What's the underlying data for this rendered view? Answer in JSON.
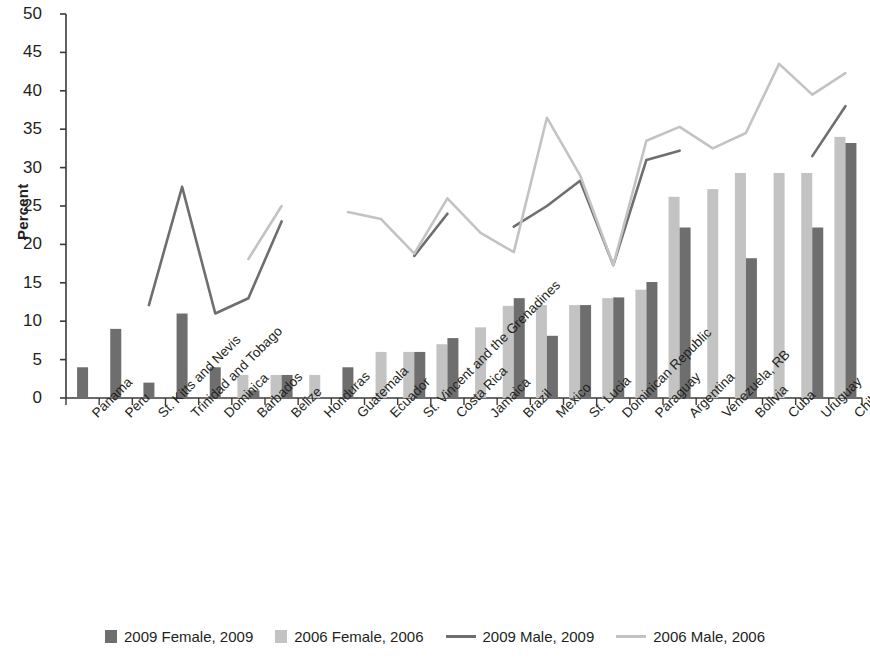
{
  "chart_data": {
    "type": "bar",
    "title": "",
    "xlabel": "",
    "ylabel": "Percent",
    "ylim": [
      0,
      50
    ],
    "ytick_step": 5,
    "yticks": [
      0,
      5,
      10,
      15,
      20,
      25,
      30,
      35,
      40,
      45,
      50
    ],
    "grid": false,
    "legend_position": "bottom",
    "categories": [
      "Panama",
      "Peru",
      "St. Kitts and Nevis",
      "Trinidad and Tobago",
      "Dominica",
      "Barbados",
      "Belize",
      "Honduras",
      "Guatemala",
      "Ecuador",
      "St. Vincent and the Grenadines",
      "Costa Rica",
      "Jamaica",
      "Brazil",
      "Mexico",
      "St. Lucia",
      "Dominican Republic",
      "Paraguay",
      "Argentina",
      "Venezuela, RB",
      "Bolivia",
      "Cuba",
      "Uruguay",
      "Chile"
    ],
    "series": [
      {
        "name": "2006 Female, 2006",
        "kind": "bar",
        "color": "#c3c3c3",
        "values": [
          null,
          null,
          null,
          null,
          null,
          3.0,
          3.0,
          3.0,
          null,
          6.0,
          6.0,
          7.0,
          9.2,
          12.0,
          12.1,
          12.1,
          13.0,
          14.1,
          26.2,
          27.2,
          29.3,
          29.3,
          29.3,
          34.0
        ]
      },
      {
        "name": "2009 Female, 2009",
        "kind": "bar",
        "color": "#6e6e6e",
        "values": [
          4.0,
          9.0,
          2.0,
          11.0,
          4.0,
          1.0,
          3.0,
          null,
          4.0,
          null,
          6.0,
          7.8,
          null,
          13.0,
          8.1,
          12.1,
          13.1,
          15.1,
          22.2,
          null,
          18.2,
          null,
          22.2,
          33.2
        ]
      },
      {
        "name": "2009 Male, 2009",
        "kind": "line",
        "color": "#6e6e6e",
        "values": [
          null,
          null,
          12.1,
          27.5,
          11.0,
          13.0,
          23.0,
          null,
          null,
          null,
          18.5,
          24.0,
          null,
          22.3,
          25.0,
          28.3,
          17.3,
          31.0,
          32.2,
          null,
          null,
          null,
          31.5,
          38.0
        ]
      },
      {
        "name": "2006 Male, 2006",
        "kind": "line",
        "color": "#c3c3c3",
        "values": [
          null,
          null,
          null,
          null,
          null,
          18.1,
          25.0,
          null,
          24.2,
          23.3,
          18.8,
          26.0,
          21.5,
          19.0,
          36.5,
          29.0,
          17.3,
          33.5,
          35.3,
          32.5,
          34.5,
          43.5,
          39.5,
          42.3
        ]
      }
    ]
  },
  "legend": {
    "items": [
      {
        "label": "2009 Female, 2009",
        "marker": "bar",
        "color": "#6e6e6e"
      },
      {
        "label": "2006 Female, 2006",
        "marker": "bar",
        "color": "#c3c3c3"
      },
      {
        "label": "2009 Male, 2009",
        "marker": "line",
        "color": "#6e6e6e"
      },
      {
        "label": "2006 Male, 2006",
        "marker": "line",
        "color": "#c3c3c3"
      }
    ]
  },
  "axis": {
    "y_title": "Percent"
  }
}
